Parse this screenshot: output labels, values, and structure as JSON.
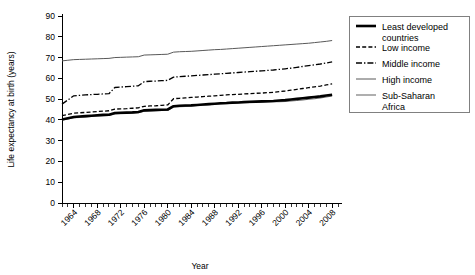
{
  "chart_data": {
    "type": "line",
    "title": "",
    "xlabel": "Year",
    "ylabel": "Life expectancy at birth (years)",
    "xlim": [
      1962,
      2009
    ],
    "ylim": [
      0,
      90
    ],
    "yticks": [
      0,
      10,
      20,
      30,
      40,
      50,
      60,
      70,
      80,
      90
    ],
    "xticks": [
      1964,
      1968,
      1972,
      1976,
      1980,
      1984,
      1988,
      1992,
      1996,
      2000,
      2004,
      2008
    ],
    "xtick_labels": [
      "1964",
      "1968",
      "1972",
      "1976",
      "1980",
      "1984",
      "1988",
      "1992",
      "1996",
      "2000",
      "2004",
      "2008"
    ],
    "x_minor_tick_step": 1,
    "grid": false,
    "legend_position": "right",
    "x": [
      1962,
      1963,
      1964,
      1965,
      1966,
      1967,
      1968,
      1969,
      1970,
      1971,
      1972,
      1973,
      1974,
      1975,
      1976,
      1977,
      1978,
      1979,
      1980,
      1981,
      1982,
      1983,
      1984,
      1985,
      1986,
      1987,
      1988,
      1989,
      1990,
      1991,
      1992,
      1993,
      1994,
      1995,
      1996,
      1997,
      1998,
      1999,
      2000,
      2001,
      2002,
      2003,
      2004,
      2005,
      2006,
      2007,
      2008
    ],
    "series": [
      {
        "name": "Least developed countries",
        "style": "solid-thick",
        "color": "#000000",
        "width": 2.6,
        "values": [
          40.2,
          40.8,
          41.4,
          41.6,
          41.8,
          42.0,
          42.2,
          42.4,
          42.5,
          43.3,
          43.4,
          43.5,
          43.6,
          43.8,
          44.6,
          44.7,
          44.8,
          44.9,
          45.0,
          46.6,
          46.8,
          46.9,
          47.0,
          47.2,
          47.4,
          47.6,
          47.8,
          48.0,
          48.1,
          48.3,
          48.4,
          48.6,
          48.7,
          48.8,
          48.9,
          49.0,
          49.1,
          49.3,
          49.5,
          49.8,
          50.1,
          50.4,
          50.7,
          51.0,
          51.3,
          51.7,
          52.1
        ]
      },
      {
        "name": "Low income",
        "style": "dashed",
        "color": "#000000",
        "width": 1.3,
        "values": [
          42.0,
          42.6,
          43.2,
          43.4,
          43.6,
          43.8,
          44.0,
          44.2,
          44.4,
          45.2,
          45.3,
          45.4,
          45.6,
          45.8,
          46.5,
          46.7,
          46.8,
          47.0,
          47.2,
          50.2,
          50.4,
          50.6,
          50.8,
          51.0,
          51.2,
          51.4,
          51.6,
          51.8,
          52.0,
          52.2,
          52.3,
          52.5,
          52.6,
          52.8,
          52.9,
          53.1,
          53.3,
          53.6,
          53.9,
          54.3,
          54.7,
          55.1,
          55.5,
          55.9,
          56.3,
          56.8,
          57.3
        ]
      },
      {
        "name": "Middle income",
        "style": "dash-dot",
        "color": "#000000",
        "width": 1.3,
        "values": [
          47.6,
          49.6,
          51.6,
          51.8,
          52.0,
          52.2,
          52.3,
          52.5,
          52.6,
          55.6,
          55.8,
          56.0,
          56.2,
          56.4,
          58.4,
          58.6,
          58.7,
          58.9,
          59.0,
          60.6,
          60.8,
          61.0,
          61.2,
          61.4,
          61.6,
          61.8,
          62.0,
          62.2,
          62.4,
          62.6,
          62.8,
          63.0,
          63.2,
          63.4,
          63.6,
          63.8,
          64.0,
          64.3,
          64.6,
          64.9,
          65.3,
          65.7,
          66.1,
          66.5,
          66.9,
          67.4,
          67.9
        ]
      },
      {
        "name": "High income",
        "style": "solid-thin",
        "color": "#595959",
        "width": 1.0,
        "values": [
          68.4,
          68.7,
          69.0,
          69.1,
          69.2,
          69.3,
          69.4,
          69.5,
          69.6,
          70.0,
          70.1,
          70.2,
          70.3,
          70.4,
          71.2,
          71.3,
          71.4,
          71.5,
          71.6,
          72.6,
          72.8,
          72.9,
          73.0,
          73.2,
          73.4,
          73.6,
          73.8,
          73.9,
          74.1,
          74.3,
          74.5,
          74.7,
          74.9,
          75.1,
          75.3,
          75.5,
          75.7,
          75.9,
          76.1,
          76.3,
          76.5,
          76.7,
          76.9,
          77.2,
          77.5,
          77.8,
          78.2
        ]
      },
      {
        "name": "Sub-Saharan Africa",
        "style": "solid-thin",
        "color": "#6e6e6e",
        "width": 1.1,
        "values": [
          40.0,
          40.5,
          41.0,
          41.2,
          41.4,
          41.6,
          41.8,
          42.0,
          42.1,
          42.9,
          43.0,
          43.1,
          43.2,
          43.4,
          44.2,
          44.3,
          44.4,
          44.5,
          44.6,
          46.2,
          46.4,
          46.5,
          46.7,
          46.9,
          47.1,
          47.3,
          47.5,
          47.7,
          47.8,
          48.0,
          48.1,
          48.2,
          48.3,
          48.4,
          48.5,
          48.6,
          48.7,
          48.8,
          48.9,
          49.1,
          49.3,
          49.6,
          49.9,
          50.2,
          50.6,
          51.0,
          51.5
        ]
      }
    ],
    "legend": [
      {
        "label_line1": "Least developed",
        "label_line2": "countries",
        "style": "solid-thick"
      },
      {
        "label_line1": "Low income",
        "label_line2": "",
        "style": "dashed"
      },
      {
        "label_line1": "Middle income",
        "label_line2": "",
        "style": "dash-dot"
      },
      {
        "label_line1": "High income",
        "label_line2": "",
        "style": "solid-thin"
      },
      {
        "label_line1": "Sub-Saharan",
        "label_line2": "Africa",
        "style": "solid-thin"
      }
    ]
  }
}
